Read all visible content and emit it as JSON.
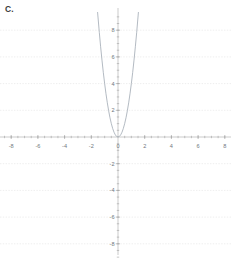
{
  "panel": {
    "label": "C."
  },
  "chart_data": {
    "type": "line",
    "title": "",
    "subtitle": "",
    "xlabel": "",
    "ylabel": "",
    "equation": "y = 4x^2",
    "xlim": [
      -9.0,
      8.6
    ],
    "ylim": [
      -9.1,
      9.4
    ],
    "grid": true,
    "grid_axis": "y",
    "legend": "none",
    "xticks": [
      -8,
      -6,
      -4,
      -2,
      0,
      2,
      4,
      6,
      8
    ],
    "xtick_labels": [
      "-8",
      "-6",
      "-4",
      "-2",
      "0",
      "2",
      "4",
      "6",
      "8"
    ],
    "yticks": [
      -8,
      -6,
      -4,
      -2,
      2,
      4,
      6,
      8
    ],
    "ytick_labels": [
      "-8",
      "-6",
      "-4",
      "-2",
      "2",
      "4",
      "6",
      "8"
    ],
    "minor_tick_step": 0.5,
    "series": [
      {
        "name": "parabola",
        "color": "#9aa3ad",
        "x": [
          -1.53,
          -1.4,
          -1.3,
          -1.2,
          -1.1,
          -1.0,
          -0.9,
          -0.8,
          -0.7,
          -0.6,
          -0.5,
          -0.4,
          -0.3,
          -0.2,
          -0.1,
          0.0,
          0.1,
          0.2,
          0.3,
          0.4,
          0.5,
          0.6,
          0.7,
          0.8,
          0.9,
          1.0,
          1.1,
          1.2,
          1.3,
          1.4,
          1.53
        ],
        "y": [
          9.36,
          7.84,
          6.76,
          5.76,
          4.84,
          4.0,
          3.24,
          2.56,
          1.96,
          1.44,
          1.0,
          0.64,
          0.36,
          0.16,
          0.04,
          0.0,
          0.04,
          0.16,
          0.36,
          0.64,
          1.0,
          1.44,
          1.96,
          2.56,
          3.24,
          4.0,
          4.84,
          5.76,
          6.76,
          7.84,
          9.36
        ]
      }
    ],
    "colors": {
      "curve": "#9aa3ad",
      "axis": "#a8a8a8",
      "grid": "#dcdcdc",
      "tick_text": "#70777e",
      "background": "#ffffff"
    }
  }
}
